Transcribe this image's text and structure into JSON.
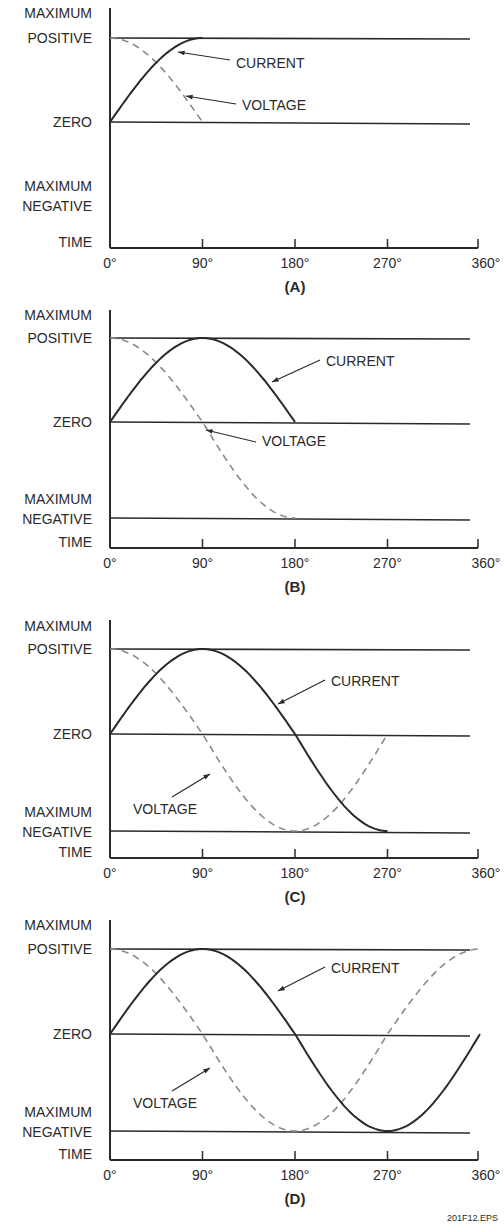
{
  "figure_id": "201F12.EPS",
  "y_labels": {
    "max_positive": [
      "MAXIMUM",
      "POSITIVE"
    ],
    "zero": "ZERO",
    "max_negative": [
      "MAXIMUM",
      "NEGATIVE"
    ],
    "time": "TIME"
  },
  "x_ticks": [
    "0°",
    "90°",
    "180°",
    "270°",
    "360°"
  ],
  "series_labels": {
    "current": "CURRENT",
    "voltage": "VOLTAGE"
  },
  "colors": {
    "current": "#2a2a2a",
    "voltage": "#8a8a8a",
    "axis": "#2a2a2a"
  },
  "panels": [
    {
      "caption": "(A)",
      "extent_deg": 90
    },
    {
      "caption": "(B)",
      "extent_deg": 180
    },
    {
      "caption": "(C)",
      "extent_deg": 270
    },
    {
      "caption": "(D)",
      "extent_deg": 360
    }
  ],
  "chart_data": {
    "type": "line",
    "xlabel": "TIME",
    "ylabel": "",
    "x": [
      0,
      90,
      180,
      270,
      360
    ],
    "y_categories": [
      "MAXIMUM NEGATIVE",
      "ZERO",
      "MAXIMUM POSITIVE"
    ],
    "ylim": [
      -1,
      1
    ],
    "series": [
      {
        "name": "CURRENT",
        "style": "solid",
        "values": [
          0,
          1,
          0,
          -1,
          0
        ]
      },
      {
        "name": "VOLTAGE",
        "style": "dashed",
        "values": [
          1,
          0,
          -1,
          0,
          1
        ]
      }
    ],
    "panels": [
      {
        "caption": "(A)",
        "x_range": [
          0,
          90
        ]
      },
      {
        "caption": "(B)",
        "x_range": [
          0,
          180
        ]
      },
      {
        "caption": "(C)",
        "x_range": [
          0,
          270
        ]
      },
      {
        "caption": "(D)",
        "x_range": [
          0,
          360
        ]
      }
    ]
  }
}
